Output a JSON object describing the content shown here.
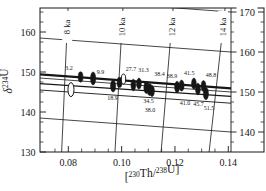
{
  "figure": {
    "background": "#ffffff",
    "ink": "#161616",
    "description_labels": {
      "xlabel": "[230Th/238U]",
      "ylabel": "d234U"
    }
  },
  "chart_data": {
    "type": "scatter",
    "title": "",
    "xlabel_parts": [
      {
        "t": "[",
        "sup": false
      },
      {
        "t": "230",
        "sup": true
      },
      {
        "t": "Th/",
        "sup": false
      },
      {
        "t": "238",
        "sup": true
      },
      {
        "t": "U]",
        "sup": false
      }
    ],
    "ylabel_parts": [
      {
        "t": "δ",
        "sup": false
      },
      {
        "t": "234",
        "sup": true
      },
      {
        "t": "U",
        "sup": false
      }
    ],
    "xlim": [
      0.0694,
      0.1414
    ],
    "ylim": [
      130,
      166
    ],
    "x_ticks": [
      0.08,
      0.1,
      0.12,
      0.14
    ],
    "x_tick_labels": [
      "0.08",
      "0.10",
      "0.12",
      "0.14"
    ],
    "x_minor_step": 0.005,
    "y_left_ticks": [
      130,
      140,
      150,
      160
    ],
    "y_left_tick_labels": [
      "130",
      "140",
      "150",
      "160"
    ],
    "y_minor_step": 2.5,
    "y_right_ticks": [
      140,
      150,
      160,
      170
    ],
    "y_right_tick_labels": [
      "140",
      "150",
      "160",
      "170"
    ],
    "y_right_scale_offset": 5,
    "grid": "isochron-mesh",
    "legend": "none",
    "age_isochrons": [
      {
        "label": "8 ka",
        "x_top": 0.0799,
        "x_bottom": 0.0775
      },
      {
        "label": "10 ka",
        "x_top": 0.1005,
        "x_bottom": 0.0975
      },
      {
        "label": "12 ka",
        "x_top": 0.1193,
        "x_bottom": 0.1148
      },
      {
        "label": "14 ka",
        "x_top": 0.1388,
        "x_bottom": 0.1328
      }
    ],
    "initial_contours": {
      "values": [
        170,
        160,
        150,
        140
      ],
      "delta_at_left": -1.5,
      "delta_at_right": -5.0
    },
    "fit_lines": [
      {
        "left": 149.4,
        "right": 145.9,
        "width": 2.4
      },
      {
        "left": 147.1,
        "right": 143.9,
        "width": 1.3
      },
      {
        "left": 145.5,
        "right": 142.2,
        "width": 0.9
      }
    ],
    "points": [
      {
        "label": "3.2",
        "x": 0.0846,
        "y": 148.75,
        "lx": 0.0803,
        "ly": 151.0,
        "open": false,
        "rx": 2.4,
        "ry": 5.2
      },
      {
        "label": "9.9",
        "x": 0.0893,
        "y": 148.4,
        "lx": 0.0921,
        "ly": 150.0,
        "open": false,
        "rx": 2.6,
        "ry": 6.5
      },
      {
        "label": "18.9",
        "x": 0.0968,
        "y": 146.5,
        "lx": 0.0966,
        "ly": 143.5,
        "open": false,
        "rx": 2.6,
        "ry": 6.0
      },
      {
        "label": "",
        "x": 0.0992,
        "y": 147.4,
        "lx": null,
        "ly": null,
        "open": false,
        "rx": 2.4,
        "ry": 5.2
      },
      {
        "label": "27.7",
        "x": 0.1044,
        "y": 146.75,
        "lx": 0.1035,
        "ly": 150.75,
        "open": false,
        "rx": 2.4,
        "ry": 5.8
      },
      {
        "label": "31.3",
        "x": 0.1065,
        "y": 147.1,
        "lx": 0.1082,
        "ly": 150.4,
        "open": false,
        "rx": 2.4,
        "ry": 5.5
      },
      {
        "label": "38.4",
        "x": 0.1093,
        "y": 146.1,
        "lx": 0.1142,
        "ly": 149.4,
        "open": false,
        "rx": 2.6,
        "ry": 6.0
      },
      {
        "label": "34.5",
        "x": 0.1105,
        "y": 145.6,
        "lx": 0.1101,
        "ly": 142.8,
        "open": false,
        "rx": 2.6,
        "ry": 6.0
      },
      {
        "label": "38.0",
        "x": 0.1114,
        "y": 145.25,
        "lx": 0.1106,
        "ly": 140.5,
        "open": false,
        "rx": 2.4,
        "ry": 5.5
      },
      {
        "label": "38.9",
        "x": 0.1208,
        "y": 146.25,
        "lx": 0.1189,
        "ly": 149.0,
        "open": false,
        "rx": 2.5,
        "ry": 5.8
      },
      {
        "label": "41.0",
        "x": 0.1225,
        "y": 146.6,
        "lx": 0.1238,
        "ly": 142.25,
        "open": false,
        "rx": 2.5,
        "ry": 5.5
      },
      {
        "label": "41.5",
        "x": 0.1271,
        "y": 147.1,
        "lx": 0.1254,
        "ly": 149.75,
        "open": false,
        "rx": 2.4,
        "ry": 5.5
      },
      {
        "label": "45.7",
        "x": 0.1286,
        "y": 145.75,
        "lx": 0.1288,
        "ly": 142.0,
        "open": false,
        "rx": 2.5,
        "ry": 5.8
      },
      {
        "label": "48.8",
        "x": 0.1307,
        "y": 146.5,
        "lx": 0.1335,
        "ly": 149.25,
        "open": false,
        "rx": 2.4,
        "ry": 5.5
      },
      {
        "label": "51.5",
        "x": 0.1316,
        "y": 144.6,
        "lx": 0.1328,
        "ly": 141.0,
        "open": false,
        "rx": 2.6,
        "ry": 6.2
      },
      {
        "label": "",
        "x": 0.081,
        "y": 145.6,
        "lx": null,
        "ly": null,
        "open": true,
        "rx": 3.0,
        "ry": 7.0
      },
      {
        "label": "",
        "x": 0.1007,
        "y": 148.25,
        "lx": null,
        "ly": null,
        "open": true,
        "rx": 2.2,
        "ry": 5.0
      }
    ]
  }
}
